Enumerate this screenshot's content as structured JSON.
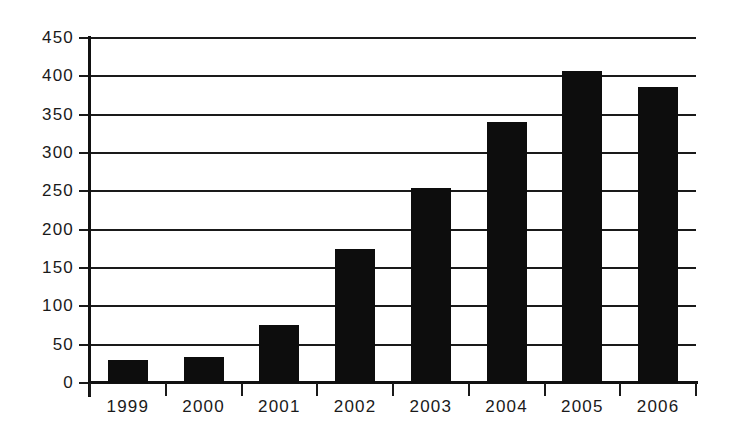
{
  "chart_data": {
    "type": "bar",
    "title": "",
    "subtitle": "",
    "xlabel": "",
    "ylabel": "",
    "categories": [
      "1999",
      "2000",
      "2001",
      "2002",
      "2003",
      "2004",
      "2005",
      "2006"
    ],
    "values": [
      30,
      34,
      76,
      175,
      254,
      340,
      407,
      386
    ],
    "ylim": [
      0,
      450
    ],
    "ytick_step": 50,
    "yticks": [
      0,
      50,
      100,
      150,
      200,
      250,
      300,
      350,
      400,
      450
    ],
    "ytick_labels": [
      "0",
      "50",
      "100",
      "150",
      "200",
      "250",
      "300",
      "350",
      "400",
      "450"
    ],
    "grid": true,
    "grid_axis": "y",
    "legend": false,
    "legend_position": "none",
    "bar_color": "#0d0d0d",
    "axis_color": "#1a1a1a",
    "background_color": "#ffffff",
    "series": [
      {
        "name": "",
        "values": [
          30,
          34,
          76,
          175,
          254,
          340,
          407,
          386
        ]
      }
    ]
  }
}
